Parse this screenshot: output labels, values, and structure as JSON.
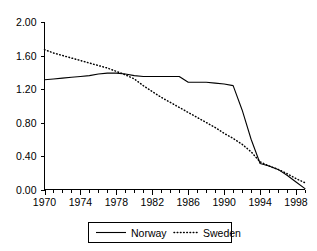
{
  "chart_data": {
    "type": "line",
    "title": "",
    "subtitle": "",
    "xlabel": "",
    "ylabel": "",
    "xlim": [
      1970,
      1999
    ],
    "ylim": [
      0.0,
      2.0
    ],
    "grid": false,
    "legend_position": "bottom-center",
    "y_ticks": [
      "0.00",
      "0.40",
      "0.80",
      "1.20",
      "1.60",
      "2.00"
    ],
    "y_tick_values": [
      0.0,
      0.4,
      0.8,
      1.2,
      1.6,
      2.0
    ],
    "x_ticks": [
      "1970",
      "1974",
      "1978",
      "1982",
      "1986",
      "1990",
      "1994",
      "1998"
    ],
    "x_tick_values": [
      1970,
      1974,
      1978,
      1982,
      1986,
      1990,
      1994,
      1998
    ],
    "x_minor_tick_step": 1,
    "x": [
      1970,
      1971,
      1972,
      1973,
      1974,
      1975,
      1976,
      1977,
      1978,
      1979,
      1980,
      1981,
      1982,
      1983,
      1984,
      1985,
      1986,
      1987,
      1988,
      1989,
      1990,
      1991,
      1992,
      1993,
      1994,
      1995,
      1996,
      1997,
      1998,
      1999
    ],
    "series": [
      {
        "name": "Norway",
        "style": "solid",
        "color": "#000000",
        "values": [
          1.31,
          1.32,
          1.33,
          1.34,
          1.35,
          1.36,
          1.38,
          1.39,
          1.39,
          1.38,
          1.36,
          1.35,
          1.35,
          1.35,
          1.35,
          1.35,
          1.28,
          1.28,
          1.28,
          1.27,
          1.26,
          1.24,
          0.95,
          0.6,
          0.31,
          0.28,
          0.24,
          0.17,
          0.09,
          0.01
        ]
      },
      {
        "name": "Sweden",
        "style": "dotted",
        "color": "#000000",
        "values": [
          1.67,
          1.63,
          1.6,
          1.57,
          1.54,
          1.51,
          1.48,
          1.45,
          1.41,
          1.37,
          1.32,
          1.24,
          1.17,
          1.1,
          1.04,
          0.98,
          0.92,
          0.86,
          0.8,
          0.74,
          0.67,
          0.61,
          0.54,
          0.45,
          0.33,
          0.28,
          0.24,
          0.19,
          0.13,
          0.08
        ]
      }
    ],
    "legend": [
      {
        "label": "Norway",
        "style": "solid"
      },
      {
        "label": "Sweden",
        "style": "dotted"
      }
    ]
  }
}
